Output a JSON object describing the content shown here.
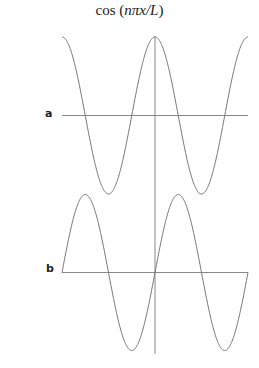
{
  "title": {
    "prefix": "cos (",
    "italic": "nπx/L",
    "suffix": ")"
  },
  "colors": {
    "curve": "#777777",
    "axis": "#888888",
    "text": "#222222"
  },
  "chart_data": [
    {
      "type": "line",
      "panel": "a",
      "function": "cos(nπx/L)",
      "title": "cos (nπx/L)",
      "x_range_periods": [
        -1,
        1
      ],
      "periods": 2,
      "amplitude": 1,
      "x": [
        -1,
        -0.75,
        -0.5,
        -0.25,
        0,
        0.25,
        0.5,
        0.75,
        1
      ],
      "y": [
        1,
        0,
        -1,
        0,
        1,
        0,
        -1,
        0,
        1
      ],
      "grid": false,
      "axes": "vertical axis through x=0, horizontal axis at y=0"
    },
    {
      "type": "line",
      "panel": "b",
      "function": "sin(nπx/L)",
      "x_range_periods": [
        -1,
        1
      ],
      "periods": 2,
      "amplitude": 1,
      "x": [
        -1,
        -0.75,
        -0.5,
        -0.25,
        0,
        0.25,
        0.5,
        0.75,
        1
      ],
      "y": [
        0,
        1,
        0,
        -1,
        0,
        1,
        0,
        -1,
        0
      ],
      "grid": false,
      "axes": "vertical axis through x=0, horizontal axis at y=0"
    }
  ],
  "labels": {
    "a": "a",
    "b": "b"
  }
}
